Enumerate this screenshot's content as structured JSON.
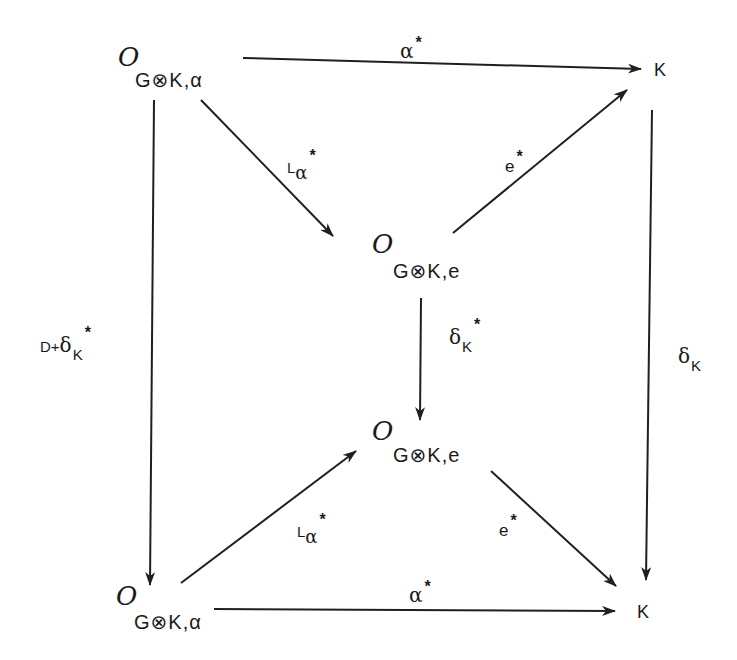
{
  "diagram": {
    "type": "commutative-diagram",
    "nodes": {
      "top_left": {
        "script": "O",
        "subscript": "G⊗K,α"
      },
      "top_right": {
        "text": "K"
      },
      "mid_upper": {
        "script": "O",
        "subscript": "G⊗K,e"
      },
      "mid_lower": {
        "script": "O",
        "subscript": "G⊗K,e"
      },
      "bottom_left": {
        "script": "O",
        "subscript": "G⊗K,α"
      },
      "bottom_right": {
        "text": "K"
      }
    },
    "arrows": {
      "top": {
        "main": "α",
        "sup": "*",
        "from": "top_left",
        "to": "top_right"
      },
      "left": {
        "prefix": "D+",
        "main": "δ",
        "sub": "K",
        "sup": "*",
        "from": "top_left",
        "to": "bottom_left"
      },
      "right": {
        "main": "δ",
        "sub": "K",
        "from": "top_right",
        "to": "bottom_right"
      },
      "diag_tl_mid": {
        "main": "L",
        "sub": "α",
        "sup": "*",
        "from": "top_left",
        "to": "mid_upper"
      },
      "diag_mid_tr": {
        "main": "e",
        "sup": "*",
        "from": "mid_upper",
        "to": "top_right"
      },
      "center": {
        "main": "δ",
        "sub": "K",
        "sup": "*",
        "from": "mid_upper",
        "to": "mid_lower"
      },
      "diag_bl_mid": {
        "main": "L",
        "sub": "α",
        "sup": "*",
        "from": "bottom_left",
        "to": "mid_lower"
      },
      "diag_mid_br": {
        "main": "e",
        "sup": "*",
        "from": "mid_lower",
        "to": "bottom_right"
      },
      "bottom": {
        "main": "α",
        "sup": "*",
        "from": "bottom_left",
        "to": "bottom_right"
      }
    },
    "colors": {
      "ink": "#1f1f1f",
      "background": "#ffffff"
    }
  }
}
